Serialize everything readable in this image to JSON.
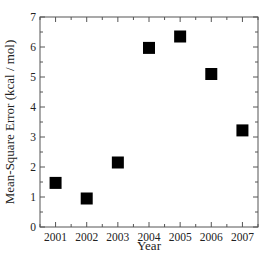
{
  "chart_data": {
    "type": "scatter",
    "title": "",
    "xlabel": "Year",
    "ylabel": "Mean-Square Error (kcal / mol)",
    "x": [
      2001,
      2002,
      2003,
      2004,
      2005,
      2006,
      2007
    ],
    "series": [
      {
        "name": "Mean-Square Error",
        "marker": "square",
        "color": "#000000",
        "values": [
          1.47,
          0.95,
          2.15,
          5.97,
          6.35,
          5.1,
          3.22
        ]
      }
    ],
    "xticks": [
      "2001",
      "2002",
      "2003",
      "2004",
      "2005",
      "2006",
      "2007"
    ],
    "yticks": [
      "0",
      "1",
      "2",
      "3",
      "4",
      "5",
      "6",
      "7"
    ],
    "xlim": [
      2000.5,
      2007.5
    ],
    "ylim": [
      0,
      7
    ],
    "grid": false,
    "legend": null
  }
}
